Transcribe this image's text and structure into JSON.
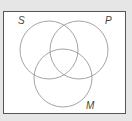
{
  "diagram": {
    "type": "venn",
    "sets": [
      {
        "label": "S",
        "cx": 49,
        "cy": 50,
        "r": 29
      },
      {
        "label": "P",
        "cx": 79,
        "cy": 50,
        "r": 29
      },
      {
        "label": "M",
        "cx": 63,
        "cy": 78,
        "r": 29
      }
    ],
    "labels": {
      "s": "S",
      "p": "P",
      "m": "M"
    },
    "colors": {
      "circle": "#9a9a9a",
      "border": "#555555",
      "background": "#e6e6e6",
      "panel": "#ffffff"
    }
  }
}
